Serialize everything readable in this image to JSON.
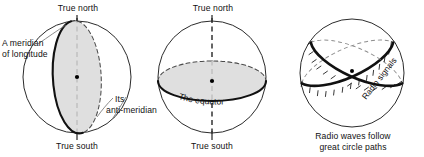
{
  "figure": {
    "caption_type": "three-sphere-earth-geometry-diagram",
    "background_color": "#ffffff",
    "ink_color": "#111111",
    "plane_fill_color": "#d9d9d9"
  },
  "panels": [
    {
      "id": "meridian-panel",
      "top_label": "True north",
      "bottom_label": "True south",
      "left_label_line1": "A meridian",
      "left_label_line2": "of longitude",
      "right_label_line1": "Its",
      "right_label_line2": "anti-meridian"
    },
    {
      "id": "equator-panel",
      "top_label": "True north",
      "bottom_label": "True south",
      "plane_label": "The equator"
    },
    {
      "id": "great-circle-panel",
      "path_label": "Radio signals",
      "caption_line1": "Radio waves follow",
      "caption_line2": "great circle paths"
    }
  ]
}
